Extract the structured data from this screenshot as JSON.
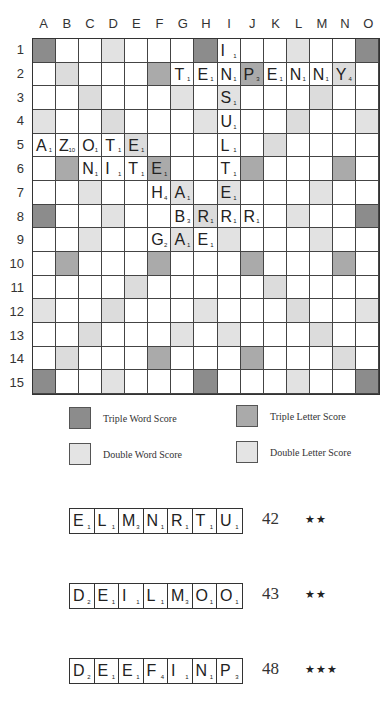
{
  "board": {
    "columns": [
      "A",
      "B",
      "C",
      "D",
      "E",
      "F",
      "G",
      "H",
      "I",
      "J",
      "K",
      "L",
      "M",
      "N",
      "O"
    ],
    "rows": [
      "1",
      "2",
      "3",
      "4",
      "5",
      "6",
      "7",
      "8",
      "9",
      "10",
      "11",
      "12",
      "13",
      "14",
      "15"
    ],
    "premium_layout": [
      "T..d...T...d..T",
      ".D...t...t...D.",
      "..D...d.d...D..",
      "d..D...d...D..d",
      "....D.....D....",
      ".t...t...t...t.",
      "..d...d.d...d..",
      "T..d...D...d..T",
      "..d...d.d...d..",
      ".t...t...t...t.",
      "....D.....D....",
      "d..D...d...D..d",
      "..D...d.d...D..",
      ".D...t...t...D.",
      "T..d...T...d..T"
    ],
    "tiles": [
      {
        "col": 8,
        "row": 0,
        "letter": "I",
        "value": "1"
      },
      {
        "col": 6,
        "row": 1,
        "letter": "T",
        "value": "1"
      },
      {
        "col": 7,
        "row": 1,
        "letter": "E",
        "value": "1"
      },
      {
        "col": 8,
        "row": 1,
        "letter": "N",
        "value": "1"
      },
      {
        "col": 9,
        "row": 1,
        "letter": "P",
        "value": "3"
      },
      {
        "col": 10,
        "row": 1,
        "letter": "E",
        "value": "1"
      },
      {
        "col": 11,
        "row": 1,
        "letter": "N",
        "value": "1"
      },
      {
        "col": 12,
        "row": 1,
        "letter": "N",
        "value": "1"
      },
      {
        "col": 13,
        "row": 1,
        "letter": "Y",
        "value": "4"
      },
      {
        "col": 8,
        "row": 2,
        "letter": "S",
        "value": "1"
      },
      {
        "col": 8,
        "row": 3,
        "letter": "U",
        "value": "1"
      },
      {
        "col": 0,
        "row": 4,
        "letter": "A",
        "value": "1"
      },
      {
        "col": 1,
        "row": 4,
        "letter": "Z",
        "value": "10"
      },
      {
        "col": 2,
        "row": 4,
        "letter": "O",
        "value": "1"
      },
      {
        "col": 3,
        "row": 4,
        "letter": "T",
        "value": "1"
      },
      {
        "col": 4,
        "row": 4,
        "letter": "E",
        "value": "1"
      },
      {
        "col": 8,
        "row": 4,
        "letter": "L",
        "value": "1"
      },
      {
        "col": 2,
        "row": 5,
        "letter": "N",
        "value": "1"
      },
      {
        "col": 3,
        "row": 5,
        "letter": "I",
        "value": "1"
      },
      {
        "col": 4,
        "row": 5,
        "letter": "T",
        "value": "1"
      },
      {
        "col": 5,
        "row": 5,
        "letter": "E",
        "value": "1"
      },
      {
        "col": 8,
        "row": 5,
        "letter": "T",
        "value": "1"
      },
      {
        "col": 5,
        "row": 6,
        "letter": "H",
        "value": "4"
      },
      {
        "col": 6,
        "row": 6,
        "letter": "A",
        "value": "1"
      },
      {
        "col": 8,
        "row": 6,
        "letter": "E",
        "value": "1"
      },
      {
        "col": 6,
        "row": 7,
        "letter": "B",
        "value": "3"
      },
      {
        "col": 7,
        "row": 7,
        "letter": "R",
        "value": "1"
      },
      {
        "col": 8,
        "row": 7,
        "letter": "R",
        "value": "1"
      },
      {
        "col": 9,
        "row": 7,
        "letter": "R",
        "value": "1"
      },
      {
        "col": 5,
        "row": 8,
        "letter": "G",
        "value": "2"
      },
      {
        "col": 6,
        "row": 8,
        "letter": "A",
        "value": "1"
      },
      {
        "col": 7,
        "row": 8,
        "letter": "E",
        "value": "1"
      }
    ]
  },
  "legend": {
    "triple_word": "Triple Word Score",
    "triple_letter": "Triple Letter Score",
    "double_word": "Double Word Score",
    "double_letter": "Double Letter Score"
  },
  "colors": {
    "triple_word": "#8c8c8c",
    "triple_letter": "#aaaaaa",
    "double_word": "#dcdcdc",
    "double_letter": "#e2e2e2"
  },
  "racks": [
    {
      "tiles": [
        [
          "E",
          "1"
        ],
        [
          "L",
          "1"
        ],
        [
          "M",
          "3"
        ],
        [
          "N",
          "1"
        ],
        [
          "R",
          "1"
        ],
        [
          "T",
          "1"
        ],
        [
          "U",
          "1"
        ]
      ],
      "score": "42",
      "stars": "★★"
    },
    {
      "tiles": [
        [
          "D",
          "2"
        ],
        [
          "E",
          "1"
        ],
        [
          "I",
          "1"
        ],
        [
          "L",
          "1"
        ],
        [
          "M",
          "3"
        ],
        [
          "O",
          "1"
        ],
        [
          "O",
          "1"
        ]
      ],
      "score": "43",
      "stars": "★★"
    },
    {
      "tiles": [
        [
          "D",
          "2"
        ],
        [
          "E",
          "1"
        ],
        [
          "E",
          "1"
        ],
        [
          "F",
          "4"
        ],
        [
          "I",
          "1"
        ],
        [
          "N",
          "1"
        ],
        [
          "P",
          "3"
        ]
      ],
      "score": "48",
      "stars": "★★★"
    }
  ]
}
